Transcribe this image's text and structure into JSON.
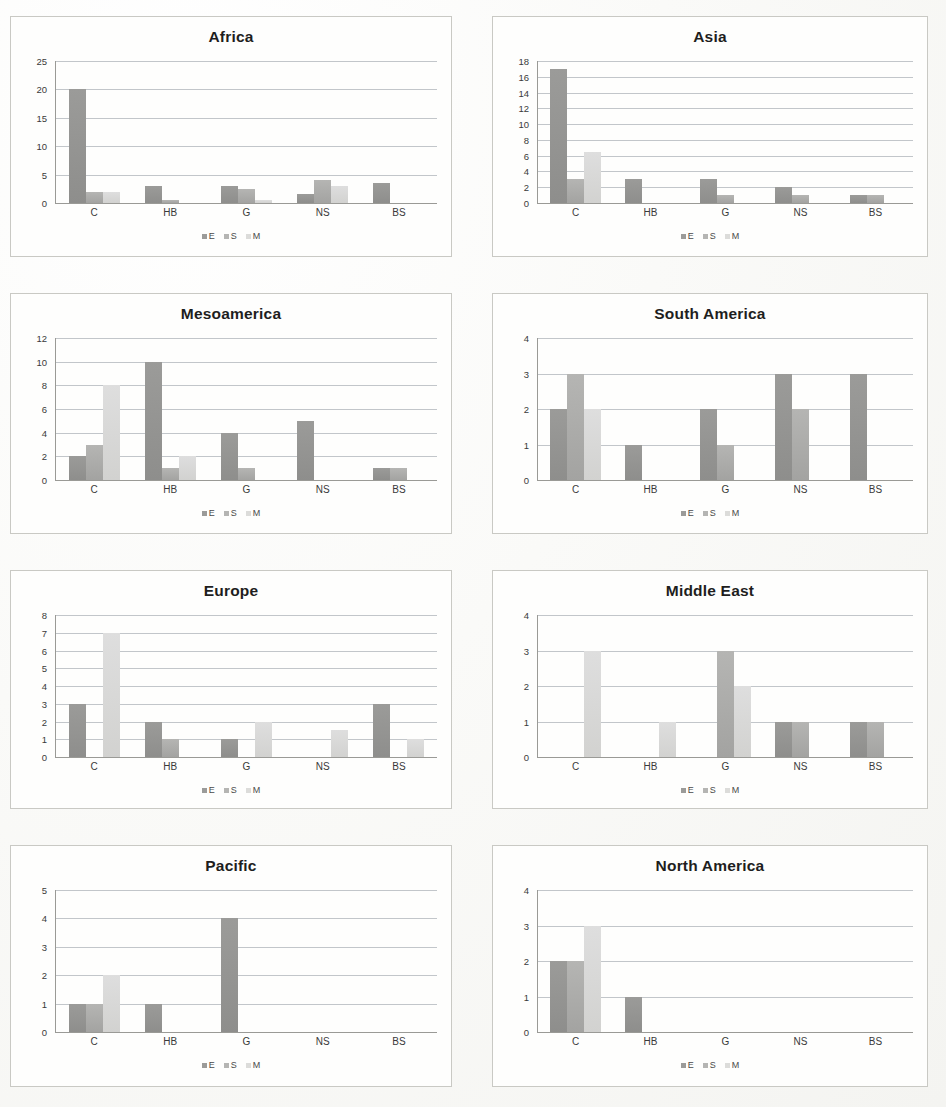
{
  "page": {
    "footer_text": "",
    "series_labels": [
      "E",
      "S",
      "M"
    ],
    "categories": [
      "C",
      "HB",
      "G",
      "NS",
      "BS"
    ],
    "colors": {
      "E": "#9b9b99",
      "S": "#b5b5b3",
      "M": "#dedede",
      "gridline": "#c2c6ca",
      "axis": "#9a9a96",
      "panel_border": "#c9c9c4",
      "background": "#fefefd"
    }
  },
  "chart_data": [
    {
      "type": "bar",
      "title": "Africa",
      "xlabel": "",
      "ylabel": "",
      "categories": [
        "C",
        "HB",
        "G",
        "NS",
        "BS"
      ],
      "yticks": [
        0,
        5,
        10,
        15,
        20,
        25
      ],
      "ylim": [
        0,
        25
      ],
      "grid": true,
      "legend": [
        "E",
        "S",
        "M"
      ],
      "legend_position": "bottom",
      "series": [
        {
          "name": "E",
          "values": [
            20,
            3,
            3,
            1.5,
            3.5
          ]
        },
        {
          "name": "S",
          "values": [
            2,
            0.5,
            2.5,
            4,
            0
          ]
        },
        {
          "name": "M",
          "values": [
            2,
            0,
            0.5,
            3,
            0
          ]
        }
      ]
    },
    {
      "type": "bar",
      "title": "Asia",
      "xlabel": "",
      "ylabel": "",
      "categories": [
        "C",
        "HB",
        "G",
        "NS",
        "BS"
      ],
      "yticks": [
        0,
        2,
        4,
        6,
        8,
        10,
        12,
        14,
        16,
        18
      ],
      "ylim": [
        0,
        18
      ],
      "grid": true,
      "legend": [
        "E",
        "S",
        "M"
      ],
      "legend_position": "bottom",
      "series": [
        {
          "name": "E",
          "values": [
            17,
            3,
            3,
            2,
            1
          ]
        },
        {
          "name": "S",
          "values": [
            3,
            0,
            1,
            1,
            1
          ]
        },
        {
          "name": "M",
          "values": [
            6.5,
            0,
            0,
            0,
            0
          ]
        }
      ]
    },
    {
      "type": "bar",
      "title": "Mesoamerica",
      "xlabel": "",
      "ylabel": "",
      "categories": [
        "C",
        "HB",
        "G",
        "NS",
        "BS"
      ],
      "yticks": [
        0,
        2,
        4,
        6,
        8,
        10,
        12
      ],
      "ylim": [
        0,
        12
      ],
      "grid": true,
      "legend": [
        "E",
        "S",
        "M"
      ],
      "legend_position": "bottom",
      "series": [
        {
          "name": "E",
          "values": [
            2,
            10,
            4,
            5,
            1
          ]
        },
        {
          "name": "S",
          "values": [
            3,
            1,
            1,
            0,
            1
          ]
        },
        {
          "name": "M",
          "values": [
            8,
            2,
            0,
            0,
            0
          ]
        }
      ]
    },
    {
      "type": "bar",
      "title": "South America",
      "xlabel": "",
      "ylabel": "",
      "categories": [
        "C",
        "HB",
        "G",
        "NS",
        "BS"
      ],
      "yticks": [
        0,
        1,
        2,
        3,
        4
      ],
      "ylim": [
        0,
        4
      ],
      "grid": true,
      "legend": [
        "E",
        "S",
        "M"
      ],
      "legend_position": "bottom",
      "series": [
        {
          "name": "E",
          "values": [
            2,
            1,
            2,
            3,
            3
          ]
        },
        {
          "name": "S",
          "values": [
            3,
            0,
            1,
            2,
            0
          ]
        },
        {
          "name": "M",
          "values": [
            2,
            0,
            0,
            0,
            0
          ]
        }
      ]
    },
    {
      "type": "bar",
      "title": "Europe",
      "xlabel": "",
      "ylabel": "",
      "categories": [
        "C",
        "HB",
        "G",
        "NS",
        "BS"
      ],
      "yticks": [
        0,
        1,
        2,
        3,
        4,
        5,
        6,
        7,
        8
      ],
      "ylim": [
        0,
        8
      ],
      "grid": true,
      "legend": [
        "E",
        "S",
        "M"
      ],
      "legend_position": "bottom",
      "series": [
        {
          "name": "E",
          "values": [
            3,
            2,
            1,
            0,
            3
          ]
        },
        {
          "name": "S",
          "values": [
            0,
            1,
            0,
            0,
            0
          ]
        },
        {
          "name": "M",
          "values": [
            7,
            0,
            2,
            1.5,
            1
          ]
        }
      ]
    },
    {
      "type": "bar",
      "title": "Middle East",
      "xlabel": "",
      "ylabel": "",
      "categories": [
        "C",
        "HB",
        "G",
        "NS",
        "BS"
      ],
      "yticks": [
        0,
        1,
        2,
        3,
        4
      ],
      "ylim": [
        0,
        4
      ],
      "grid": true,
      "legend": [
        "E",
        "S",
        "M"
      ],
      "legend_position": "bottom",
      "series": [
        {
          "name": "E",
          "values": [
            0,
            0,
            0,
            1,
            1
          ]
        },
        {
          "name": "S",
          "values": [
            0,
            0,
            3,
            1,
            1
          ]
        },
        {
          "name": "M",
          "values": [
            3,
            1,
            2,
            0,
            0
          ]
        }
      ]
    },
    {
      "type": "bar",
      "title": "Pacific",
      "xlabel": "",
      "ylabel": "",
      "categories": [
        "C",
        "HB",
        "G",
        "NS",
        "BS"
      ],
      "yticks": [
        0,
        1,
        2,
        3,
        4,
        5
      ],
      "ylim": [
        0,
        5
      ],
      "grid": true,
      "legend": [
        "E",
        "S",
        "M"
      ],
      "legend_position": "bottom",
      "series": [
        {
          "name": "E",
          "values": [
            1,
            1,
            4,
            0,
            0
          ]
        },
        {
          "name": "S",
          "values": [
            1,
            0,
            0,
            0,
            0
          ]
        },
        {
          "name": "M",
          "values": [
            2,
            0,
            0,
            0,
            0
          ]
        }
      ]
    },
    {
      "type": "bar",
      "title": "North America",
      "xlabel": "",
      "ylabel": "",
      "categories": [
        "C",
        "HB",
        "G",
        "NS",
        "BS"
      ],
      "yticks": [
        0,
        1,
        2,
        3,
        4
      ],
      "ylim": [
        0,
        4
      ],
      "grid": true,
      "legend": [
        "E",
        "S",
        "M"
      ],
      "legend_position": "bottom",
      "series": [
        {
          "name": "E",
          "values": [
            2,
            1,
            0,
            0,
            0
          ]
        },
        {
          "name": "S",
          "values": [
            2,
            0,
            0,
            0,
            0
          ]
        },
        {
          "name": "M",
          "values": [
            3,
            0,
            0,
            0,
            0
          ]
        }
      ]
    }
  ]
}
